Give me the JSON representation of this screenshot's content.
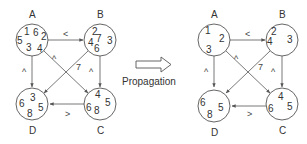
{
  "propagation_label": "Propagation",
  "left_graph": {
    "nodes": {
      "A": {
        "label": "A",
        "values": [
          "1",
          "6",
          "2",
          "5",
          "3",
          "4"
        ]
      },
      "B": {
        "label": "B",
        "values": [
          "2",
          "4",
          "7",
          "3",
          "6"
        ]
      },
      "C": {
        "label": "C",
        "values": [
          "4",
          "5",
          "6",
          "8"
        ]
      },
      "D": {
        "label": "D",
        "values": [
          "3",
          "6",
          "5",
          "8"
        ]
      }
    },
    "edges": [
      {
        "from": "A",
        "to": "B",
        "op": "<"
      },
      {
        "from": "A",
        "to": "D",
        "op": "^"
      },
      {
        "from": "B",
        "to": "C",
        "op": "^"
      },
      {
        "from": "C",
        "to": "D",
        "op": ">"
      },
      {
        "from": "A",
        "to": "C",
        "op": "^"
      },
      {
        "from": "B",
        "to": "D",
        "op": "7"
      }
    ]
  },
  "right_graph": {
    "nodes": {
      "A": {
        "label": "A",
        "values": [
          "1",
          "2",
          "3"
        ]
      },
      "B": {
        "label": "B",
        "values": [
          "2",
          "4",
          "3"
        ]
      },
      "C": {
        "label": "C",
        "values": [
          "4",
          "6",
          "5"
        ]
      },
      "D": {
        "label": "D",
        "values": [
          "6",
          "5",
          "8"
        ]
      }
    },
    "edges": [
      {
        "from": "A",
        "to": "B",
        "op": "<"
      },
      {
        "from": "A",
        "to": "D",
        "op": "^"
      },
      {
        "from": "B",
        "to": "C",
        "op": "^"
      },
      {
        "from": "C",
        "to": "D",
        "op": ">"
      },
      {
        "from": "A",
        "to": "C",
        "op": "^"
      },
      {
        "from": "B",
        "to": "D",
        "op": "7"
      }
    ]
  }
}
